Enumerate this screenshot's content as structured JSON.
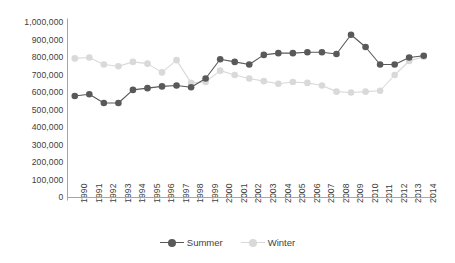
{
  "chart_data": {
    "type": "line",
    "title": "",
    "subtitle": "",
    "xlabel": "",
    "ylabel": "",
    "grid": false,
    "legend_position": "bottom",
    "ylim": [
      0,
      1000000
    ],
    "ytick_step": 100000,
    "ytick_labels": [
      "1,000,000",
      "900,000",
      "800,000",
      "700,000",
      "600,000",
      "500,000",
      "400,000",
      "300,000",
      "200,000",
      "100,000",
      "0"
    ],
    "ytick_values": [
      1000000,
      900000,
      800000,
      700000,
      600000,
      500000,
      400000,
      300000,
      200000,
      100000,
      0
    ],
    "categories": [
      "1990",
      "1991",
      "1992",
      "1993",
      "1994",
      "1995",
      "1996",
      "1997",
      "1998",
      "1999",
      "2000",
      "2001",
      "2002",
      "2003",
      "2004",
      "2005",
      "2006",
      "2007",
      "2008",
      "2009",
      "2010",
      "2011",
      "2012",
      "2013",
      "2014"
    ],
    "series": [
      {
        "name": "Summer",
        "color": "#595959",
        "marker": "circle",
        "values": [
          580000,
          590000,
          540000,
          540000,
          615000,
          625000,
          635000,
          640000,
          630000,
          680000,
          790000,
          775000,
          760000,
          815000,
          825000,
          825000,
          830000,
          830000,
          820000,
          930000,
          860000,
          760000,
          760000,
          800000,
          810000
        ]
      },
      {
        "name": "Winter",
        "color": "#d9d9d9",
        "marker": "circle",
        "values": [
          795000,
          800000,
          760000,
          750000,
          775000,
          765000,
          715000,
          785000,
          655000,
          660000,
          725000,
          700000,
          680000,
          665000,
          650000,
          660000,
          655000,
          640000,
          605000,
          600000,
          605000,
          610000,
          700000,
          780000,
          805000
        ]
      }
    ]
  },
  "legend": {
    "entries": [
      {
        "label": "Summer"
      },
      {
        "label": "Winter"
      }
    ]
  },
  "axis": {
    "line_color": "#a6a6a6"
  }
}
